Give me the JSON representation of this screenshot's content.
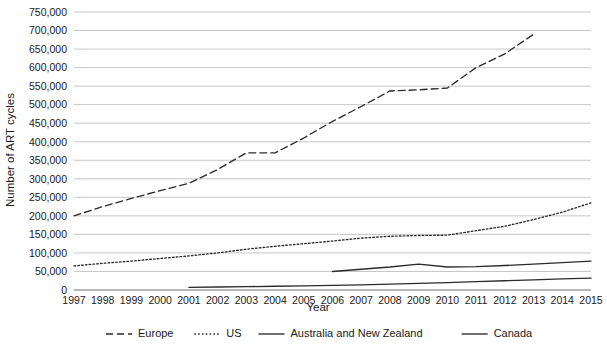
{
  "chart_data": {
    "type": "line",
    "title": "",
    "xlabel": "Year",
    "ylabel": "Number of ART cycles",
    "x": [
      1997,
      1998,
      1999,
      2000,
      2001,
      2002,
      2003,
      2004,
      2005,
      2006,
      2007,
      2008,
      2009,
      2010,
      2011,
      2012,
      2013,
      2014,
      2015
    ],
    "xlim": [
      1997,
      2015
    ],
    "ylim": [
      0,
      750000
    ],
    "ytick_labels": [
      "0",
      "50,000",
      "100,000",
      "150,000",
      "200,000",
      "250,000",
      "300,000",
      "350,000",
      "400,000",
      "450,000",
      "500,000",
      "550,000",
      "600,000",
      "650,000",
      "700,000",
      "750,000"
    ],
    "ytick_values": [
      0,
      50000,
      100000,
      150000,
      200000,
      250000,
      300000,
      350000,
      400000,
      450000,
      500000,
      550000,
      600000,
      650000,
      700000,
      750000
    ],
    "xtick_labels": [
      "1997",
      "1998",
      "1999",
      "2000",
      "2001",
      "2002",
      "2003",
      "2004",
      "2005",
      "2006",
      "2007",
      "2008",
      "2009",
      "2010",
      "2011",
      "2012",
      "2013",
      "2014",
      "2015"
    ],
    "grid": true,
    "grid_axis": "y",
    "legend_position": "bottom",
    "series": [
      {
        "name": "Europe",
        "style": "dashed",
        "dash": "7,4",
        "color": "#2b2b2b",
        "x": [
          1997,
          1998,
          1999,
          2000,
          2001,
          2002,
          2003,
          2004,
          2005,
          2006,
          2007,
          2008,
          2009,
          2010,
          2011,
          2012,
          2013
        ],
        "values": [
          200000,
          225000,
          247000,
          268000,
          288000,
          325000,
          370000,
          370000,
          410000,
          455000,
          495000,
          537000,
          540000,
          545000,
          600000,
          637000,
          690000
        ]
      },
      {
        "name": "US",
        "style": "dotted",
        "dash": "1.6,2.2",
        "color": "#2b2b2b",
        "x": [
          1997,
          1998,
          1999,
          2000,
          2001,
          2002,
          2003,
          2004,
          2005,
          2006,
          2007,
          2008,
          2009,
          2010,
          2011,
          2012,
          2013,
          2014,
          2015
        ],
        "values": [
          65000,
          72000,
          78000,
          85000,
          92000,
          100000,
          110000,
          118000,
          125000,
          132000,
          140000,
          145000,
          147000,
          148000,
          160000,
          172000,
          190000,
          210000,
          235000
        ]
      },
      {
        "name": "Australia and New Zealand",
        "style": "solid",
        "dash": "",
        "color": "#4a4a4a",
        "x": [
          2006,
          2007,
          2008,
          2009,
          2010,
          2011,
          2012,
          2013,
          2014,
          2015
        ],
        "values": [
          50000,
          56000,
          62000,
          70000,
          62000,
          63000,
          66000,
          70000,
          74000,
          78000
        ]
      },
      {
        "name": "Canada",
        "style": "solid",
        "dash": "",
        "color": "#4a4a4a",
        "x": [
          2001,
          2002,
          2003,
          2004,
          2005,
          2006,
          2007,
          2008,
          2009,
          2010,
          2011,
          2012,
          2013,
          2014,
          2015
        ],
        "values": [
          7000,
          8000,
          9000,
          10000,
          11000,
          12500,
          14000,
          16000,
          18000,
          20000,
          22500,
          25000,
          27500,
          30000,
          32000
        ]
      }
    ]
  },
  "legend": {
    "items": [
      {
        "label": "Europe"
      },
      {
        "label": "US"
      },
      {
        "label": "Australia and New Zealand"
      },
      {
        "label": "Canada"
      }
    ]
  }
}
